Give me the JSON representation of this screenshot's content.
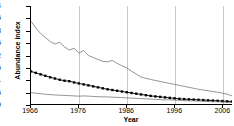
{
  "chart_data": {
    "type": "line",
    "title": "",
    "xlabel": "Year",
    "ylabel": "Abundance index",
    "xlim": [
      1966,
      2008
    ],
    "ylim": [
      0,
      4
    ],
    "grid": "vertical-only",
    "legend": "none",
    "ytick_labels": [
      "0",
      "0.5",
      "1",
      "1.5",
      "2",
      "2.5",
      "3",
      "3.5",
      "4"
    ],
    "ytick_values": [
      0,
      0.5,
      1,
      1.5,
      2,
      2.5,
      3,
      3.5,
      4
    ],
    "xtick_labels": [
      "1966",
      "1976",
      "1986",
      "1996",
      "2006"
    ],
    "xtick_values": [
      1966,
      1976,
      1986,
      1996,
      2006
    ],
    "x": [
      1966,
      1967,
      1968,
      1969,
      1970,
      1971,
      1972,
      1973,
      1974,
      1975,
      1976,
      1977,
      1978,
      1979,
      1980,
      1981,
      1982,
      1983,
      1984,
      1985,
      1986,
      1987,
      1988,
      1989,
      1990,
      1991,
      1992,
      1993,
      1994,
      1995,
      1996,
      1997,
      1998,
      1999,
      2000,
      2001,
      2002,
      2003,
      2004,
      2005,
      2006,
      2007,
      2008
    ],
    "series": [
      {
        "name": "upper-confidence-bound",
        "style": "line",
        "color": "#666666",
        "values": [
          3.38,
          3.1,
          2.88,
          2.72,
          2.55,
          2.45,
          2.52,
          2.33,
          2.2,
          2.28,
          2.08,
          2.18,
          1.98,
          1.9,
          1.82,
          1.74,
          1.72,
          1.78,
          1.66,
          1.56,
          1.48,
          1.34,
          1.22,
          1.1,
          1.05,
          1.0,
          0.96,
          0.92,
          0.88,
          0.84,
          0.8,
          0.76,
          0.72,
          0.68,
          0.64,
          0.6,
          0.57,
          0.54,
          0.51,
          0.48,
          0.44,
          0.4,
          0.33
        ]
      },
      {
        "name": "abundance-index-estimate",
        "style": "line-with-square-markers",
        "color": "#000000",
        "values": [
          1.33,
          1.27,
          1.21,
          1.15,
          1.09,
          1.04,
          0.99,
          0.95,
          0.93,
          0.88,
          0.84,
          0.8,
          0.76,
          0.72,
          0.68,
          0.64,
          0.6,
          0.57,
          0.54,
          0.51,
          0.48,
          0.45,
          0.42,
          0.39,
          0.36,
          0.33,
          0.31,
          0.29,
          0.27,
          0.25,
          0.23,
          0.21,
          0.2,
          0.19,
          0.18,
          0.17,
          0.16,
          0.15,
          0.14,
          0.13,
          0.12,
          0.11,
          0.1
        ]
      },
      {
        "name": "lower-confidence-bound",
        "style": "line",
        "color": "#666666",
        "values": [
          0.47,
          0.44,
          0.42,
          0.4,
          0.38,
          0.37,
          0.36,
          0.35,
          0.34,
          0.33,
          0.32,
          0.33,
          0.32,
          0.31,
          0.3,
          0.29,
          0.29,
          0.28,
          0.27,
          0.26,
          0.25,
          0.24,
          0.23,
          0.22,
          0.21,
          0.2,
          0.19,
          0.18,
          0.17,
          0.17,
          0.16,
          0.15,
          0.14,
          0.13,
          0.13,
          0.12,
          0.11,
          0.1,
          0.09,
          0.09,
          0.08,
          0.07,
          0.06
        ]
      }
    ]
  }
}
